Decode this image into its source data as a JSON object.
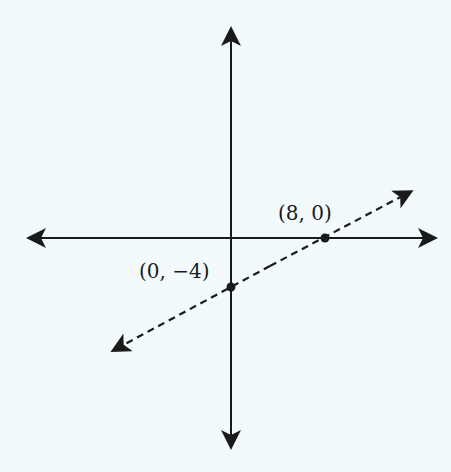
{
  "diagram": {
    "type": "coordinate-plane-line",
    "axes": {
      "x_axis": "horizontal, arrows both ends",
      "y_axis": "vertical, arrows both ends"
    },
    "line": {
      "style": "dashed",
      "arrows": "both ends"
    },
    "points": [
      {
        "label": "(8, 0)",
        "x": 8,
        "y": 0
      },
      {
        "label": "(0, −4)",
        "x": 0,
        "y": -4
      }
    ]
  },
  "colors": {
    "background": "#f3fafc",
    "ink": "#1a1a1a"
  }
}
